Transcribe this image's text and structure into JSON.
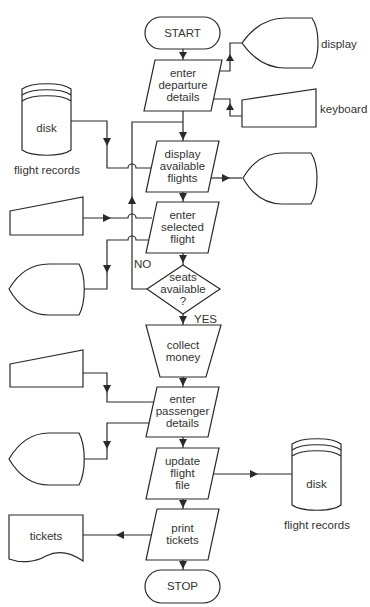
{
  "diagram": {
    "type": "flowchart",
    "colors": {
      "stroke": "#2a2a2a",
      "text": "#333333",
      "background": "#ffffff"
    },
    "process_nodes": [
      {
        "id": "start",
        "shape": "terminator",
        "label": "START"
      },
      {
        "id": "enter_departure",
        "shape": "parallelogram",
        "label": "enter\ndeparture\ndetails"
      },
      {
        "id": "display_flights",
        "shape": "parallelogram",
        "label": "display\navailable\nflights"
      },
      {
        "id": "enter_selected",
        "shape": "parallelogram",
        "label": "enter\nselected\nflight"
      },
      {
        "id": "seats_available",
        "shape": "diamond",
        "label": "seats\navailable\n?"
      },
      {
        "id": "collect_money",
        "shape": "trapezoid",
        "label": "collect\nmoney"
      },
      {
        "id": "enter_passenger",
        "shape": "parallelogram",
        "label": "enter\npassenger\ndetails"
      },
      {
        "id": "update_file",
        "shape": "parallelogram",
        "label": "update\nflight\nfile"
      },
      {
        "id": "print_tickets",
        "shape": "parallelogram",
        "label": "print\ntickets"
      },
      {
        "id": "stop",
        "shape": "terminator",
        "label": "STOP"
      }
    ],
    "devices": [
      {
        "id": "display_top",
        "shape": "display",
        "label": "display"
      },
      {
        "id": "keyboard_top",
        "shape": "manual-input",
        "label": "keyboard"
      },
      {
        "id": "disk_top",
        "shape": "disk",
        "label": "disk",
        "caption": "flight records"
      },
      {
        "id": "display_mid",
        "shape": "display",
        "label": ""
      },
      {
        "id": "keyboard_mid",
        "shape": "manual-input",
        "label": ""
      },
      {
        "id": "display_left",
        "shape": "display",
        "label": ""
      },
      {
        "id": "keyboard_left2",
        "shape": "manual-input",
        "label": ""
      },
      {
        "id": "display_left2",
        "shape": "display",
        "label": ""
      },
      {
        "id": "disk_bottom",
        "shape": "disk",
        "label": "disk",
        "caption": "flight records"
      },
      {
        "id": "tickets_doc",
        "shape": "document",
        "label": "tickets"
      }
    ],
    "decision_labels": {
      "no": "NO",
      "yes": "YES"
    },
    "edges": [
      {
        "from": "start",
        "to": "enter_departure"
      },
      {
        "from": "enter_departure",
        "to": "display_top"
      },
      {
        "from": "keyboard_top",
        "to": "enter_departure"
      },
      {
        "from": "enter_departure",
        "to": "display_flights"
      },
      {
        "from": "disk_top",
        "to": "display_flights"
      },
      {
        "from": "display_flights",
        "to": "display_mid"
      },
      {
        "from": "display_flights",
        "to": "enter_selected"
      },
      {
        "from": "keyboard_mid",
        "to": "enter_selected"
      },
      {
        "from": "enter_selected",
        "to": "display_left"
      },
      {
        "from": "enter_selected",
        "to": "seats_available"
      },
      {
        "from": "seats_available",
        "to": "display_flights",
        "label": "NO"
      },
      {
        "from": "seats_available",
        "to": "collect_money",
        "label": "YES"
      },
      {
        "from": "collect_money",
        "to": "enter_passenger"
      },
      {
        "from": "keyboard_left2",
        "to": "enter_passenger"
      },
      {
        "from": "enter_passenger",
        "to": "display_left2"
      },
      {
        "from": "enter_passenger",
        "to": "update_file"
      },
      {
        "from": "update_file",
        "to": "disk_bottom"
      },
      {
        "from": "update_file",
        "to": "print_tickets"
      },
      {
        "from": "print_tickets",
        "to": "tickets_doc"
      },
      {
        "from": "print_tickets",
        "to": "stop"
      }
    ]
  }
}
